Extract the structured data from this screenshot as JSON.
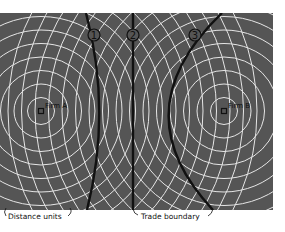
{
  "diagram": {
    "background_color": "#555555",
    "circle_color": "#e6e6e6",
    "boundary_color": "#111111",
    "firms": [
      {
        "label": "Firm A",
        "x": 41,
        "y": 111
      },
      {
        "label": "Firm B",
        "x": 224,
        "y": 111
      }
    ],
    "ring_spacing": 13.5,
    "ring_count": 16,
    "boundaries": [
      {
        "label": "1"
      },
      {
        "label": "2"
      },
      {
        "label": "3"
      }
    ],
    "annotations": {
      "distance_units": "Distance units",
      "trade_boundary": "Trade boundary"
    }
  }
}
